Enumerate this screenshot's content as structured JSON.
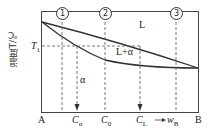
{
  "diagram": {
    "y_axis_label": "温度T/℃",
    "temperature_label": "T",
    "temperature_sub": "1",
    "region_liquid": "L",
    "region_two_phase": "L+α",
    "region_solid": "α",
    "markers": [
      "1",
      "2",
      "3"
    ],
    "x_labels": {
      "left": "A",
      "right": "B",
      "c_alpha": "C",
      "c_alpha_sub": "α",
      "c_0": "C",
      "c_0_sub": "0",
      "c_L": "C",
      "c_L_sub": "L",
      "composition": "→w",
      "composition_sub": "B"
    },
    "colors": {
      "line": "#333333",
      "background": "#ffffff"
    }
  }
}
